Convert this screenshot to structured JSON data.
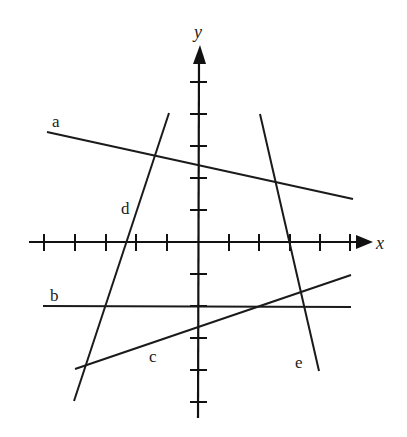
{
  "diagram": {
    "type": "coordinate-plane-with-lines",
    "axes": {
      "x_label": "x",
      "y_label": "y",
      "x_ticks": [
        -5,
        -4,
        -3,
        -2,
        -1,
        1,
        2,
        3,
        4,
        5
      ],
      "y_ticks": [
        -5,
        -4,
        -3,
        -2,
        -1,
        1,
        2,
        3,
        4,
        5
      ]
    },
    "lines": [
      {
        "label": "a",
        "from": [
          -5.0,
          3.4
        ],
        "to": [
          5.1,
          1.3
        ]
      },
      {
        "label": "b",
        "from": [
          -5.1,
          -2.0
        ],
        "to": [
          5.0,
          -2.0
        ]
      },
      {
        "label": "c",
        "from": [
          -4.0,
          -4.0
        ],
        "to": [
          5.0,
          -1.0
        ]
      },
      {
        "label": "d",
        "from": [
          -3.6,
          -5.0
        ],
        "to": [
          -0.95,
          4.0
        ]
      },
      {
        "label": "e",
        "from": [
          2.0,
          4.0
        ],
        "to": [
          3.95,
          -4.0
        ]
      }
    ]
  },
  "labels": {
    "a": "a",
    "b": "b",
    "c": "c",
    "d": "d",
    "e": "e",
    "x": "x",
    "y": "y"
  }
}
